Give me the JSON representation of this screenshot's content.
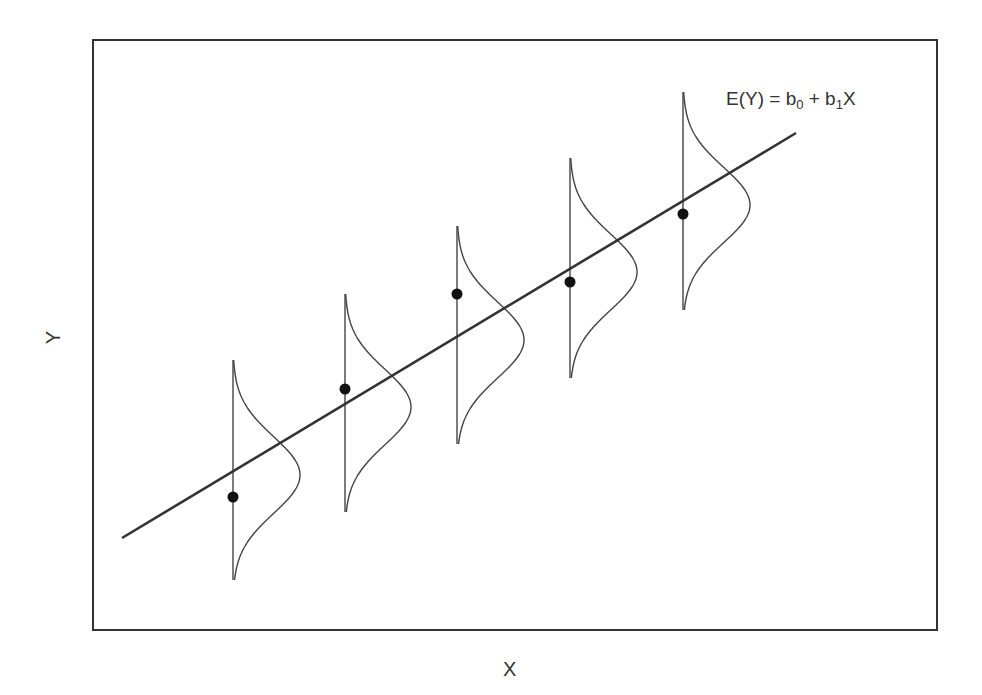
{
  "diagram": {
    "title": "",
    "equation": {
      "lhs": "E(Y) = b",
      "sub0": "0",
      "mid": " + b",
      "sub1": "1",
      "rhs": "X"
    },
    "xlabel": "X",
    "ylabel": "Y",
    "frame": {
      "left": 93,
      "top": 40,
      "right": 937,
      "bottom": 630
    },
    "regression_line": {
      "x1": 122,
      "y1": 538,
      "x2": 796,
      "y2": 133
    },
    "colors": {
      "frame": "#333333",
      "line": "#333333",
      "curve": "#444444",
      "point": "#111111"
    },
    "distributions": [
      {
        "x": 233,
        "top": 360,
        "bottom": 580,
        "peak_y": 475,
        "peak_x": 300,
        "point_y": 497
      },
      {
        "x": 345,
        "top": 294,
        "bottom": 512,
        "peak_y": 407,
        "peak_x": 411,
        "point_y": 389
      },
      {
        "x": 457,
        "top": 226,
        "bottom": 444,
        "peak_y": 340,
        "peak_x": 524,
        "point_y": 294
      },
      {
        "x": 570,
        "top": 158,
        "bottom": 378,
        "peak_y": 272,
        "peak_x": 637,
        "point_y": 282
      },
      {
        "x": 683,
        "top": 92,
        "bottom": 310,
        "peak_y": 205,
        "peak_x": 750,
        "point_y": 214
      }
    ]
  }
}
